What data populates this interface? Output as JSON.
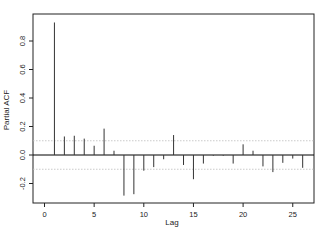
{
  "chart_data": {
    "type": "bar",
    "subtype": "partial-autocorrelation (PACF) spike plot",
    "title": "",
    "xlabel": "Lag",
    "ylabel": "Partial ACF",
    "xlim": [
      -1,
      27
    ],
    "ylim": [
      -0.33,
      0.98
    ],
    "xticks": [
      0,
      5,
      10,
      15,
      20,
      25
    ],
    "xtick_labels": [
      "0",
      "5",
      "10",
      "15",
      "20",
      "25"
    ],
    "yticks": [
      -0.2,
      0.0,
      0.2,
      0.4,
      0.6,
      0.8
    ],
    "ytick_labels": [
      "-0.2",
      "0.0",
      "0.2",
      "0.4",
      "0.6",
      "0.8"
    ],
    "grid": false,
    "legend": null,
    "confidence_bounds": [
      -0.1,
      0.1
    ],
    "x": [
      1,
      2,
      3,
      4,
      5,
      6,
      7,
      8,
      9,
      10,
      11,
      12,
      13,
      14,
      15,
      16,
      17,
      18,
      19,
      20,
      21,
      22,
      23,
      24,
      25,
      26
    ],
    "values": [
      0.93,
      0.13,
      0.135,
      0.115,
      0.065,
      0.185,
      0.03,
      -0.285,
      -0.275,
      -0.11,
      -0.085,
      -0.03,
      0.14,
      -0.07,
      -0.17,
      -0.06,
      -0.005,
      -0.005,
      -0.06,
      0.075,
      0.03,
      -0.08,
      -0.12,
      -0.055,
      -0.025,
      -0.09
    ],
    "colors": {
      "spike": "#333333",
      "zero_line": "#000000",
      "bounds": "#bdbdbd",
      "axis": "#222222"
    }
  },
  "labels": {
    "xlabel": "Lag",
    "ylabel": "Partial ACF"
  }
}
